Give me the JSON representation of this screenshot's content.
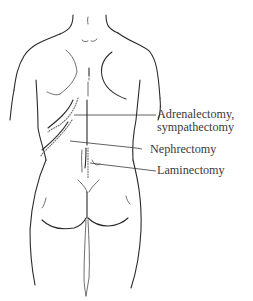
{
  "figure": {
    "labels": [
      {
        "id": "adrenalectomy",
        "line1": "Adrenalectomy,",
        "line2": "sympathectomy"
      },
      {
        "id": "nephrectomy",
        "line1": "Nephrectomy"
      },
      {
        "id": "laminectomy",
        "line1": "Laminectomy"
      }
    ],
    "colors": {
      "background": "#ffffff",
      "line": "#2a2a2a",
      "incision_dots": "#6a6a6a",
      "label_text": "#3a3a3a"
    }
  }
}
